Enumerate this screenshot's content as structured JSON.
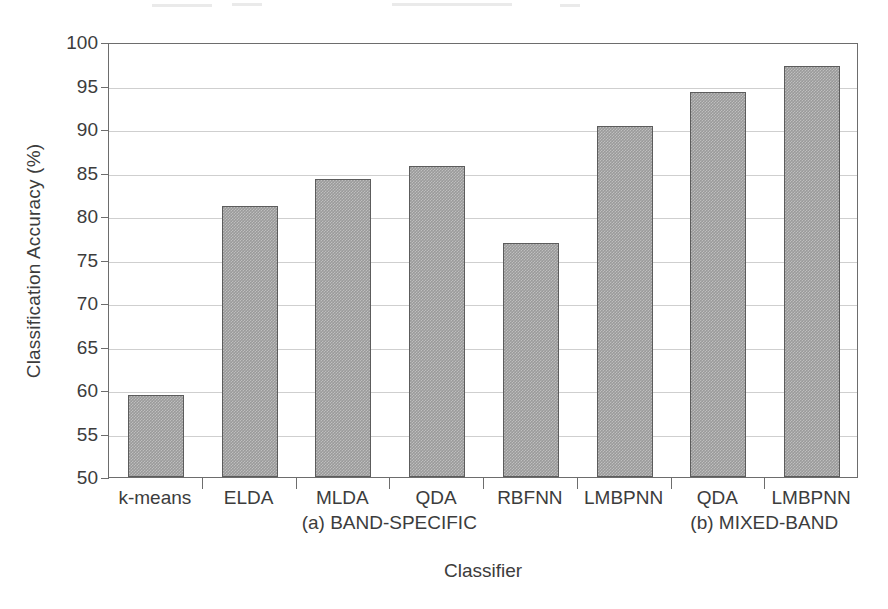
{
  "chart_data": {
    "type": "bar",
    "title": "",
    "xlabel": "Classifier",
    "ylabel": "Classification Accuracy (%)",
    "ylim": [
      50,
      100
    ],
    "ytick_step": 5,
    "yticks": [
      50,
      55,
      60,
      65,
      70,
      75,
      80,
      85,
      90,
      95,
      100
    ],
    "grid": true,
    "legend": "none",
    "categories": [
      "k-means",
      "ELDA",
      "MLDA",
      "QDA",
      "RBFNN",
      "LMBPNN",
      "QDA",
      "LMBPNN"
    ],
    "values": [
      59.4,
      81.2,
      84.3,
      85.8,
      76.9,
      90.3,
      94.3,
      97.2
    ],
    "series": [
      {
        "name": "Classification Accuracy",
        "values": [
          59.4,
          81.2,
          84.3,
          85.8,
          76.9,
          90.3,
          94.3,
          97.2
        ]
      }
    ],
    "groups": [
      {
        "label": "(a) BAND-SPECIFIC",
        "category_indices": [
          0,
          1,
          2,
          3,
          4,
          5
        ]
      },
      {
        "label": "(b) MIXED-BAND",
        "category_indices": [
          6,
          7
        ]
      }
    ],
    "bar_color": "#9a9a9a",
    "bar_border_color": "#5c5c5c",
    "grid_color": "#cfcfcf",
    "axis_color": "#6d6d6d",
    "text_color": "#3c3c3c"
  }
}
